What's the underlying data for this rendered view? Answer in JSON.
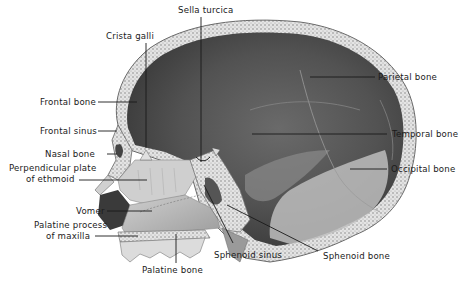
{
  "figure": {
    "labels": {
      "sella_turcica": "Sella turcica",
      "crista_galli": "Crista galli",
      "frontal_bone": "Frontal bone",
      "frontal_sinus": "Frontal sinus",
      "nasal_bone": "Nasal bone",
      "perpendicular_plate_1": "Perpendicular plate",
      "perpendicular_plate_2": "of ethmoid",
      "vomer": "Vomer",
      "palatine_process_1": "Palatine process",
      "palatine_process_2": "of maxilla",
      "palatine_bone": "Palatine bone",
      "sphenoid_sinus": "Sphenoid sinus",
      "sphenoid_bone": "Sphenoid bone",
      "parietal_bone": "Parietal bone",
      "temporal_bone": "Temporal bone",
      "occipital_bone": "Occipital bone"
    },
    "colors": {
      "background": "#ffffff",
      "inner_cranium": "#4a4a4a",
      "bone_light": "#d8d8d8",
      "bone_mid": "#a8a8a8",
      "leader_line": "#1a1a1a",
      "text": "#1a1a1a"
    }
  }
}
